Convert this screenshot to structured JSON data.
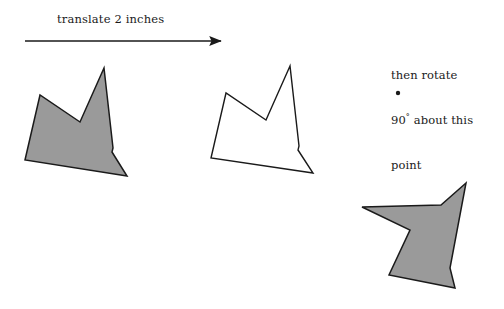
{
  "figure": {
    "title_text_left": "translate 2 inches",
    "annotation_right": {
      "line1": "then rotate",
      "line2_value": "90",
      "line2_degree": "°",
      "line2_rest": " about this",
      "line3": "point"
    },
    "colors": {
      "shape_fill_gray": "#9a9a9a",
      "shape_fill_white": "#ffffff",
      "stroke": "#1a1a1a",
      "background": "#ffffff",
      "text": "#1a1a1a"
    },
    "arrow": {
      "name": "translation-arrow",
      "x_start": 25,
      "x_end": 226,
      "y": 41,
      "stroke_width": 1.4
    },
    "rotation_point": {
      "name": "rotation-center-dot",
      "cx": 398,
      "cy": 93,
      "r": 2.2
    },
    "shapes": [
      {
        "id": "original-shape",
        "label": "original gray polygon",
        "fill": "gray",
        "points": "104,68 80,122 40,95 25,160 127,176 112,152 113,148"
      },
      {
        "id": "translated-shape",
        "label": "translated white polygon",
        "fill": "white",
        "points": "290,66 266,120 226,93 211,158 313,173 298,150 299,146"
      },
      {
        "id": "rotated-shape",
        "label": "rotated gray polygon",
        "fill": "gray",
        "points": "466,183 441,205 362,207 410,230 389,275 455,288 450,268"
      }
    ]
  }
}
